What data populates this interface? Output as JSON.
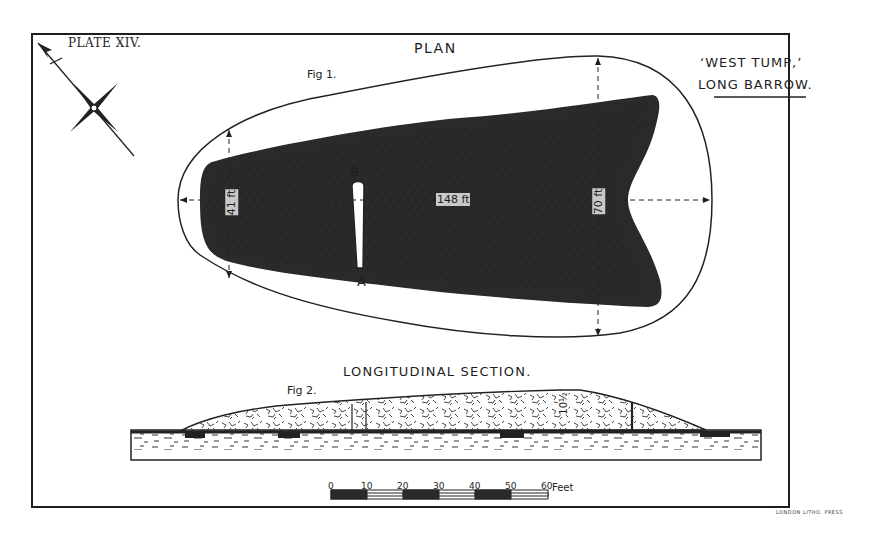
{
  "plate": {
    "number": "PLATE XIV.",
    "site_title_line1": "‘WEST TUMP,’",
    "site_title_line2": "LONG BARROW."
  },
  "plan": {
    "title": "PLAN",
    "figure_label": "Fig 1.",
    "points": {
      "a": "A",
      "b": "B"
    },
    "dimensions": {
      "length": "148 ft",
      "wide_end": "70 ft",
      "narrow_end": "41 ft",
      "horn_gap": "11 ft"
    }
  },
  "section": {
    "title": "LONGITUDINAL SECTION.",
    "figure_label": "Fig 2.",
    "height_label": "10½"
  },
  "scale_bar": {
    "ticks": [
      "0",
      "10",
      "20",
      "30",
      "40",
      "50",
      "60"
    ],
    "unit": "Feet"
  },
  "compass": {
    "icon": "north-arrow-compass-icon"
  },
  "imprint": "LONDON LITHO. PRESS",
  "colors": {
    "ink": "#1e1e1e",
    "paper": "#ffffff"
  }
}
